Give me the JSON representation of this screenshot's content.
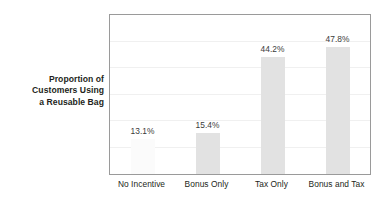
{
  "chart_data": {
    "type": "bar",
    "title": "",
    "subtitle": "",
    "xlabel": "",
    "ylabel": "Proportion of Customers Using a Reusable Bag",
    "categories": [
      "No Incentive",
      "Bonus Only",
      "Tax Only",
      "Bonus and Tax"
    ],
    "values": [
      13.1,
      15.4,
      44.2,
      47.8
    ],
    "value_labels": [
      "13.1%",
      "15.4%",
      "44.2%",
      "47.8%"
    ],
    "unit": "%",
    "ylim": [
      0,
      60
    ],
    "grid": true,
    "gridlines": [
      10,
      20,
      30,
      40,
      50
    ],
    "legend": "none",
    "series": [
      {
        "name": "Proportion of Customers Using a Reusable Bag",
        "values": [
          13.1,
          15.4,
          44.2,
          47.8
        ]
      }
    ],
    "bar_color": "#e2e2e2",
    "first_bar_color": "#fbfbfb",
    "label_color": "#3b3b3b",
    "frame_color": "#9a9a9a",
    "grid_color": "#f0f0f0",
    "background": "#ffffff"
  },
  "ylabel_lines": [
    "Proportion of",
    "Customers Using",
    "a Reusable Bag"
  ]
}
